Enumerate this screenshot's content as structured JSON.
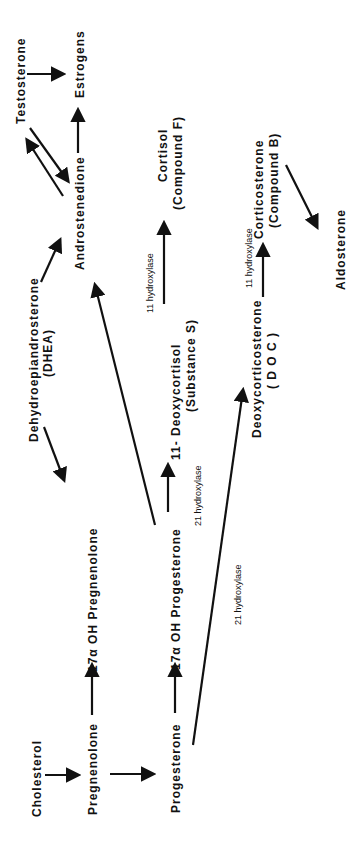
{
  "diagram": {
    "orientation": "rotated-90-ccw",
    "nodes": {
      "cholesterol": "Cholesterol",
      "pregnenolone": "Pregnenolone",
      "progesterone": "Progesterone",
      "oh17_preg": "17α OH Pregnenolone",
      "oh17_prog": "17α OH Progesterone",
      "dhea_1": "Dehydroepiandrosterone",
      "dhea_2": "(DHEA)",
      "androstenedione": "Androstenedione",
      "testosterone": "Testosterone",
      "estrogens": "Estrogens",
      "deoxycortisol_1": "11-   Deoxycortisol",
      "deoxycortisol_2": "(Substance  S)",
      "cortisol_1": "Cortisol",
      "cortisol_2": "(Compound  F)",
      "doc_1": "Deoxycorticosterone",
      "doc_2": "( D O C )",
      "corticosterone_1": "Corticosterone",
      "corticosterone_2": "(Compound  B)",
      "aldosterone": "Aldosterone"
    },
    "enzymes": {
      "e21_a": "21  hydroxylase",
      "e21_b": "21  hydroxylase",
      "e11_a": "11  hydroxylase",
      "e11_b": "11  hydroxylase"
    },
    "edges": [
      {
        "from": "Cholesterol",
        "to": "Pregnenolone"
      },
      {
        "from": "Pregnenolone",
        "to": "Progesterone"
      },
      {
        "from": "Pregnenolone",
        "to": "17α OH Pregnenolone"
      },
      {
        "from": "Progesterone",
        "to": "17α OH Progesterone"
      },
      {
        "from": "DHEA",
        "to": "17α OH Pregnenolone"
      },
      {
        "from": "DHEA",
        "to": "Androstenedione"
      },
      {
        "from": "17α OH Progesterone",
        "to": "Androstenedione"
      },
      {
        "from": "Androstenedione",
        "to": "Testosterone"
      },
      {
        "from": "Testosterone",
        "to": "Androstenedione"
      },
      {
        "from": "Androstenedione",
        "to": "Estrogens"
      },
      {
        "from": "Testosterone",
        "to": "Estrogens"
      },
      {
        "from": "17α OH Progesterone",
        "to": "11-Deoxycortisol",
        "enzyme": "21 hydroxylase"
      },
      {
        "from": "11-Deoxycortisol",
        "to": "Cortisol",
        "enzyme": "11 hydroxylase"
      },
      {
        "from": "Progesterone",
        "to": "Deoxycorticosterone",
        "enzyme": "21 hydroxylase"
      },
      {
        "from": "Deoxycorticosterone",
        "to": "Corticosterone",
        "enzyme": "11 hydroxylase"
      },
      {
        "from": "Corticosterone",
        "to": "Aldosterone"
      }
    ]
  }
}
